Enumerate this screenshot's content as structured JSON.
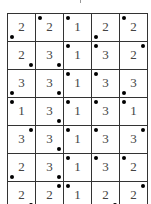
{
  "grid": {
    "columns": 5,
    "rows": [
      {
        "cells": [
          {
            "value": "2",
            "dot": "bl"
          },
          {
            "value": "2",
            "dot": "tl"
          },
          {
            "value": "1",
            "dot": "tl"
          },
          {
            "value": "2",
            "dot": "bl"
          },
          {
            "value": "2",
            "dot": "tl"
          }
        ]
      },
      {
        "cells": [
          {
            "value": "2",
            "dot": "br"
          },
          {
            "value": "3",
            "dot": "br"
          },
          {
            "value": "1",
            "dot": "tl"
          },
          {
            "value": "3",
            "dot": "tl"
          },
          {
            "value": "2",
            "dot": "tr"
          }
        ]
      },
      {
        "cells": [
          {
            "value": "3",
            "dot": "bl"
          },
          {
            "value": "3",
            "dot": "br"
          },
          {
            "value": "1",
            "dot": "tl"
          },
          {
            "value": "3",
            "dot": "tl"
          },
          {
            "value": "3",
            "dot": "bl"
          }
        ]
      },
      {
        "cells": [
          {
            "value": "1",
            "dot": "tl"
          },
          {
            "value": "3",
            "dot": "br"
          },
          {
            "value": "1",
            "dot": "tl"
          },
          {
            "value": "3",
            "dot": "tl"
          },
          {
            "value": "1",
            "dot": "tl"
          }
        ]
      },
      {
        "cells": [
          {
            "value": "3",
            "dot": "tr"
          },
          {
            "value": "3",
            "dot": "br"
          },
          {
            "value": "1",
            "dot": "tl"
          },
          {
            "value": "3",
            "dot": "tl"
          },
          {
            "value": "3",
            "dot": "tr"
          }
        ]
      },
      {
        "cells": [
          {
            "value": "2",
            "dot": "bl"
          },
          {
            "value": "3",
            "dot": "br"
          },
          {
            "value": "1",
            "dot": "tl"
          },
          {
            "value": "3",
            "dot": "tl"
          },
          {
            "value": "2",
            "dot": "tl"
          }
        ]
      },
      {
        "cells": [
          {
            "value": "2",
            "dot": "br"
          },
          {
            "value": "2",
            "dot": "tr"
          },
          {
            "value": "1",
            "dot": "tl"
          },
          {
            "value": "2",
            "dot": "br"
          },
          {
            "value": "2",
            "dot": "tr"
          }
        ]
      }
    ]
  }
}
